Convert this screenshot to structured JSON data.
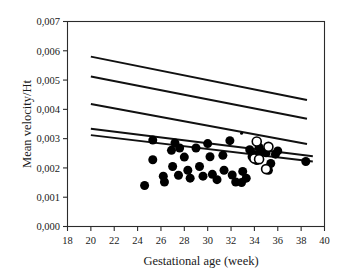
{
  "chart_data": {
    "type": "scatter",
    "title": "",
    "xlabel": "Gestational age (week)",
    "ylabel": "Mean velocity/Ht",
    "xlim": [
      18,
      40
    ],
    "ylim": [
      0.0,
      0.007
    ],
    "xticks": [
      18,
      20,
      22,
      24,
      26,
      28,
      30,
      32,
      34,
      36,
      38,
      40
    ],
    "xticklabels": [
      "18",
      "20",
      "22",
      "24",
      "26",
      "28",
      "30",
      "32",
      "34",
      "36",
      "38",
      "40"
    ],
    "yticks": [
      0.0,
      0.001,
      0.002,
      0.003,
      0.004,
      0.005,
      0.006,
      0.007
    ],
    "yticklabels": [
      "0,000",
      "0,001",
      "0,002",
      "0,003",
      "0,004",
      "0,005",
      "0,006",
      "0,007"
    ],
    "decimal_separator": ",",
    "grid": false,
    "legend": "none",
    "frame": "box",
    "series": [
      {
        "name": "Filled circles",
        "marker": "filled-circle",
        "color": "#000000",
        "marker_size": 9,
        "points": [
          [
            24.6,
            0.0014
          ],
          [
            25.3,
            0.00295
          ],
          [
            25.3,
            0.00228
          ],
          [
            26.2,
            0.00172
          ],
          [
            26.3,
            0.00152
          ],
          [
            26.9,
            0.0026
          ],
          [
            27.0,
            0.00205
          ],
          [
            27.2,
            0.00285
          ],
          [
            27.5,
            0.00175
          ],
          [
            27.6,
            0.00268
          ],
          [
            28.0,
            0.00237
          ],
          [
            28.3,
            0.00192
          ],
          [
            28.5,
            0.00165
          ],
          [
            29.0,
            0.00268
          ],
          [
            29.3,
            0.00205
          ],
          [
            29.6,
            0.00172
          ],
          [
            30.0,
            0.00283
          ],
          [
            30.2,
            0.00238
          ],
          [
            30.4,
            0.00178
          ],
          [
            30.8,
            0.0016
          ],
          [
            31.3,
            0.00243
          ],
          [
            31.4,
            0.00192
          ],
          [
            31.9,
            0.00293
          ],
          [
            32.1,
            0.00176
          ],
          [
            32.4,
            0.00152
          ],
          [
            32.9,
            0.0015
          ],
          [
            33.0,
            0.00188
          ],
          [
            33.3,
            0.00165
          ],
          [
            33.6,
            0.00262
          ],
          [
            33.8,
            0.00238
          ],
          [
            34.0,
            0.00246
          ],
          [
            34.2,
            0.00225
          ],
          [
            34.4,
            0.0027
          ],
          [
            34.6,
            0.00255
          ],
          [
            35.0,
            0.00252
          ],
          [
            35.2,
            0.00192
          ],
          [
            35.4,
            0.00215
          ],
          [
            35.8,
            0.00247
          ],
          [
            36.0,
            0.00258
          ],
          [
            38.4,
            0.00222
          ]
        ]
      },
      {
        "name": "Open circles",
        "marker": "open-circle",
        "color": "#000000",
        "marker_size": 9,
        "points": [
          [
            34.2,
            0.0029
          ],
          [
            34.0,
            0.00232
          ],
          [
            34.4,
            0.0023
          ],
          [
            35.2,
            0.00272
          ],
          [
            35.0,
            0.00196
          ]
        ]
      },
      {
        "name": "Small dot",
        "marker": "small-dot",
        "color": "#000000",
        "marker_size": 3,
        "points": [
          [
            32.9,
            0.00318
          ]
        ]
      }
    ],
    "lines": [
      {
        "name": "reference-line-1",
        "x": [
          20,
          38.5
        ],
        "y": [
          0.0058,
          0.00432
        ],
        "width": 2.0
      },
      {
        "name": "reference-line-2",
        "x": [
          20,
          38.5
        ],
        "y": [
          0.00512,
          0.00368
        ],
        "width": 2.0
      },
      {
        "name": "reference-line-3",
        "x": [
          20,
          38.5
        ],
        "y": [
          0.00418,
          0.00282
        ],
        "width": 2.0
      },
      {
        "name": "regression-line-upper",
        "x": [
          20,
          39.0
        ],
        "y": [
          0.00334,
          0.0024
        ],
        "width": 2.0
      },
      {
        "name": "regression-line-lower",
        "x": [
          20,
          39.0
        ],
        "y": [
          0.00312,
          0.00222
        ],
        "width": 2.0
      }
    ]
  }
}
